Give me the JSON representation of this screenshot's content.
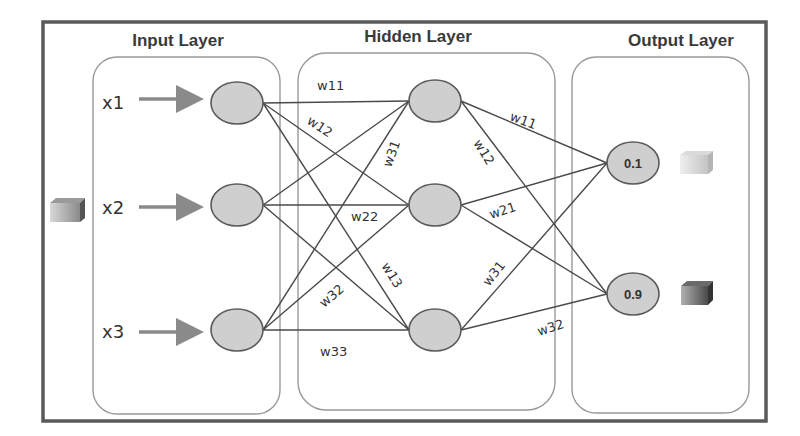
{
  "diagram": {
    "type": "feedforward-neural-network",
    "layers": [
      {
        "title": "Input Layer",
        "nodes": 3
      },
      {
        "title": "Hidden Layer",
        "nodes": 3
      },
      {
        "title": "Output Layer",
        "nodes": 2
      }
    ],
    "inputs": [
      "x1",
      "x2",
      "x3"
    ],
    "outputs": [
      "0.1",
      "0.9"
    ],
    "input_to_hidden_weights": [
      "w11",
      "w12",
      "w31",
      "w22",
      "w13",
      "w32",
      "w33"
    ],
    "hidden_to_output_weights": [
      "w11",
      "w12",
      "w21",
      "w31",
      "w32"
    ],
    "colors": {
      "frame": "#555555",
      "box": "#9a9a9a",
      "node_fill": "#cfcfcf",
      "node_stroke": "#5a5a5a",
      "arrow": "#8a8a8a",
      "edge": "#4a4a4a"
    },
    "icons": {
      "input_cube": "cube-icon",
      "output_cube_light": "cube-icon-light",
      "output_cube_dark": "cube-icon-dark"
    }
  }
}
